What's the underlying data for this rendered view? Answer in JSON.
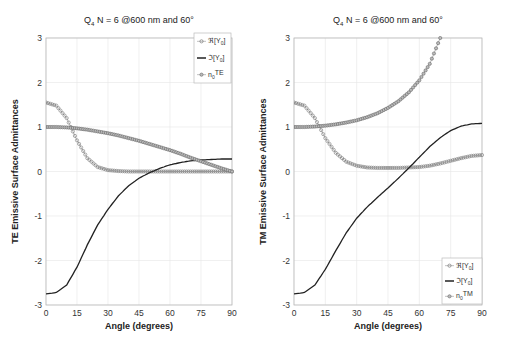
{
  "chart_data": [
    {
      "type": "line",
      "title": "Q4 N = 6 @600 nm and 60°",
      "title_parts": {
        "q": "Q",
        "q_sub": "4",
        "rest": " N = 6 @600 nm and 60°"
      },
      "xlabel": "Angle (degrees)",
      "ylabel": "TE Emissive Surface Admittances",
      "xlim": [
        0,
        90
      ],
      "ylim": [
        -3,
        3
      ],
      "xticks": [
        "0",
        "15",
        "30",
        "45",
        "60",
        "75",
        "90"
      ],
      "yticks": [
        "-3",
        "-2",
        "-1",
        "0",
        "1",
        "2",
        "3"
      ],
      "grid": true,
      "legend_position": "upper right",
      "legend": [
        "ℜ[Y0]",
        "ℑ[Y0]",
        "n0TE"
      ],
      "x": [
        0,
        5,
        10,
        15,
        20,
        25,
        30,
        35,
        40,
        45,
        50,
        55,
        60,
        65,
        70,
        75,
        80,
        85,
        90
      ],
      "series": [
        {
          "name": "ℜ[Y0]",
          "style": "circle-markers",
          "values": [
            1.55,
            1.48,
            1.2,
            0.7,
            0.3,
            0.1,
            0.03,
            0.01,
            0.0,
            0.0,
            0.0,
            0.0,
            0.0,
            0.0,
            0.0,
            0.0,
            0.0,
            0.0,
            0.0
          ]
        },
        {
          "name": "ℑ[Y0]",
          "style": "solid",
          "values": [
            -2.75,
            -2.72,
            -2.55,
            -2.15,
            -1.65,
            -1.2,
            -0.85,
            -0.55,
            -0.32,
            -0.15,
            -0.03,
            0.07,
            0.15,
            0.2,
            0.24,
            0.26,
            0.27,
            0.28,
            0.28
          ]
        },
        {
          "name": "n0TE",
          "style": "star-markers",
          "values": [
            1.0,
            1.0,
            0.99,
            0.97,
            0.94,
            0.9,
            0.86,
            0.81,
            0.75,
            0.69,
            0.62,
            0.55,
            0.48,
            0.4,
            0.31,
            0.23,
            0.15,
            0.07,
            0.0
          ]
        }
      ]
    },
    {
      "type": "line",
      "title": "Q4 N = 6 @600 nm and 60°",
      "title_parts": {
        "q": "Q",
        "q_sub": "4",
        "rest": " N = 6 @600 nm and 60°"
      },
      "xlabel": "Angle (degrees)",
      "ylabel": "TM Emissive Surface Admittances",
      "xlim": [
        0,
        90
      ],
      "ylim": [
        -3,
        3
      ],
      "xticks": [
        "0",
        "15",
        "30",
        "45",
        "60",
        "75",
        "90"
      ],
      "yticks": [
        "-3",
        "-2",
        "-1",
        "0",
        "1",
        "2",
        "3"
      ],
      "grid": true,
      "legend_position": "lower right",
      "legend": [
        "ℜ[Y0]",
        "ℑ[Y0]",
        "n0TM"
      ],
      "x": [
        0,
        5,
        10,
        15,
        20,
        25,
        30,
        35,
        40,
        45,
        50,
        55,
        60,
        65,
        70,
        75,
        80,
        85,
        90
      ],
      "series": [
        {
          "name": "ℜ[Y0]",
          "style": "circle-markers",
          "values": [
            1.55,
            1.48,
            1.2,
            0.75,
            0.42,
            0.22,
            0.13,
            0.09,
            0.08,
            0.08,
            0.08,
            0.09,
            0.1,
            0.13,
            0.18,
            0.24,
            0.3,
            0.35,
            0.37
          ]
        },
        {
          "name": "ℑ[Y0]",
          "style": "solid",
          "values": [
            -2.75,
            -2.72,
            -2.55,
            -2.2,
            -1.78,
            -1.38,
            -1.05,
            -0.8,
            -0.58,
            -0.37,
            -0.15,
            0.08,
            0.32,
            0.56,
            0.76,
            0.92,
            1.02,
            1.07,
            1.08
          ]
        },
        {
          "name": "n0TM",
          "style": "star-markers",
          "values": [
            1.0,
            1.0,
            1.01,
            1.03,
            1.06,
            1.1,
            1.15,
            1.22,
            1.31,
            1.43,
            1.58,
            1.78,
            2.05,
            2.42,
            3.0,
            null,
            null,
            null,
            null
          ]
        }
      ]
    }
  ]
}
